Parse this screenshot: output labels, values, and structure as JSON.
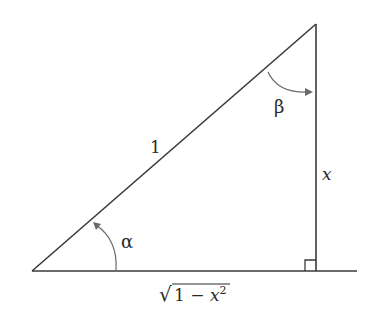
{
  "diagram": {
    "type": "right-triangle",
    "hypotenuse_label": "1",
    "vertical_side_label": "x",
    "base_label": {
      "radical": "√",
      "radicand_prefix": "1 − ",
      "variable": "x",
      "exponent": "2"
    },
    "angles": {
      "alpha": "α",
      "beta": "β"
    },
    "stroke_color": "#3a3a3a",
    "arc_color": "#6a6a6a"
  }
}
